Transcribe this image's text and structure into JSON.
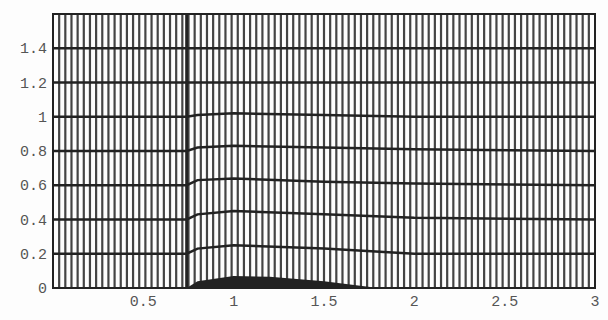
{
  "chart_data": {
    "type": "line",
    "title": "",
    "xlabel": "",
    "ylabel": "",
    "xlim": [
      0,
      3
    ],
    "ylim": [
      0,
      1.6
    ],
    "x_ticks": [
      "0.5",
      "1",
      "1.5",
      "2",
      "2.5",
      "3"
    ],
    "y_ticks": [
      "0",
      "0.2",
      "0.4",
      "0.6",
      "0.8",
      "1",
      "1.2",
      "1.4"
    ],
    "grid": true,
    "vertical_line_count": 88,
    "discontinuity_x": 0.74,
    "series": [
      {
        "name": "level-0.2",
        "x": [
          0,
          0.74,
          0.8,
          1.0,
          1.5,
          2.0,
          3.0
        ],
        "values": [
          0.2,
          0.2,
          0.23,
          0.25,
          0.23,
          0.2,
          0.2
        ]
      },
      {
        "name": "level-0.4",
        "x": [
          0,
          0.74,
          0.8,
          1.0,
          1.5,
          2.0,
          3.0
        ],
        "values": [
          0.4,
          0.4,
          0.43,
          0.45,
          0.43,
          0.41,
          0.4
        ]
      },
      {
        "name": "level-0.6",
        "x": [
          0,
          0.74,
          0.8,
          1.0,
          1.5,
          2.0,
          3.0
        ],
        "values": [
          0.6,
          0.6,
          0.63,
          0.64,
          0.62,
          0.61,
          0.6
        ]
      },
      {
        "name": "level-0.8",
        "x": [
          0,
          0.74,
          0.8,
          1.0,
          1.5,
          2.0,
          3.0
        ],
        "values": [
          0.8,
          0.8,
          0.82,
          0.83,
          0.82,
          0.81,
          0.8
        ]
      },
      {
        "name": "level-1.0",
        "x": [
          0,
          0.74,
          0.8,
          1.0,
          1.5,
          2.0,
          3.0
        ],
        "values": [
          1.0,
          1.0,
          1.01,
          1.02,
          1.01,
          1.0,
          1.0
        ]
      },
      {
        "name": "level-1.2",
        "x": [
          0,
          3.0
        ],
        "values": [
          1.2,
          1.2
        ]
      },
      {
        "name": "level-1.4",
        "x": [
          0,
          3.0
        ],
        "values": [
          1.4,
          1.4
        ]
      },
      {
        "name": "bottom-hump",
        "x": [
          0.74,
          0.8,
          1.0,
          1.2,
          1.5,
          1.8
        ],
        "values": [
          0.0,
          0.04,
          0.07,
          0.065,
          0.04,
          0.0
        ]
      }
    ],
    "legend": []
  }
}
